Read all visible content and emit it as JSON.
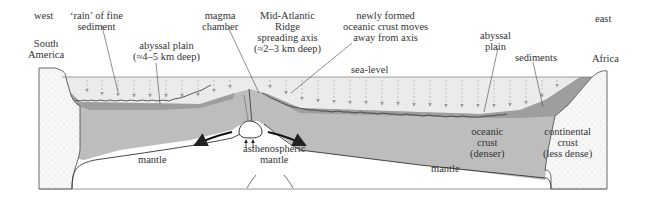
{
  "labels": {
    "west": "west",
    "east": "east",
    "south_america": [
      "South",
      "America"
    ],
    "africa": "Africa",
    "rain_sediment": [
      "‘rain’ of fine",
      "sediment"
    ],
    "abyssal_plain_west": [
      "abyssal plain",
      "(≈4–5 km deep)"
    ],
    "magma_chamber": [
      "magma",
      "chamber"
    ],
    "ridge": [
      "Mid-Atlantic",
      "Ridge",
      "spreading axis",
      "(≈2–3 km deep)"
    ],
    "new_crust": [
      "newly formed",
      "oceanic crust moves",
      "away from axis"
    ],
    "sea_level": "sea-level",
    "abyssal_plain_east": [
      "abyssal",
      "plain"
    ],
    "sediments": "sediments",
    "mantle_left": "mantle",
    "mantle_right": "mantle",
    "asthenospheric_mantle": [
      "asthenospheric",
      "mantle"
    ],
    "oceanic_crust": [
      "oceanic",
      "crust",
      "(denser)"
    ],
    "continental_crust": [
      "continental",
      "crust",
      "(less dense)"
    ]
  },
  "colors": {
    "sea": "#ebebeb",
    "sediment": "#9a9a9a",
    "oceanic_crust": "#b9b9b9",
    "continent": "#f6f6f6",
    "mantle": "#ffffff",
    "line": "#333333",
    "rain_arrow": "#9a9a9a"
  }
}
